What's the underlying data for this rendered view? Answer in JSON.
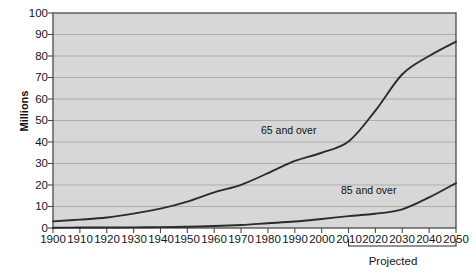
{
  "chart_data": {
    "type": "line",
    "title": "",
    "xlabel": "",
    "ylabel": "Millions",
    "xlim": [
      1900,
      2050
    ],
    "ylim": [
      0,
      100
    ],
    "grid": true,
    "legend_position": "inline-annotation",
    "x": [
      1900,
      1910,
      1920,
      1930,
      1940,
      1950,
      1960,
      1970,
      1980,
      1990,
      2000,
      2010,
      2020,
      2030,
      2040,
      2050
    ],
    "xtick_labels": [
      "1900",
      "1910",
      "1920",
      "1930",
      "1940",
      "1950",
      "1960",
      "1970",
      "1980",
      "1990",
      "2000",
      "2010",
      "2020",
      "2030",
      "2040",
      "2050"
    ],
    "ytick_labels": [
      "0",
      "10",
      "20",
      "30",
      "40",
      "50",
      "60",
      "70",
      "80",
      "90",
      "100"
    ],
    "ytick_values": [
      0,
      10,
      20,
      30,
      40,
      50,
      60,
      70,
      80,
      90,
      100
    ],
    "series": [
      {
        "name": "65 and over",
        "label": "65 and over",
        "values": [
          3.1,
          3.9,
          4.9,
          6.7,
          9.0,
          12.3,
          16.6,
          20.1,
          25.5,
          31.2,
          35.0,
          40.2,
          54.6,
          71.5,
          80.0,
          86.7
        ],
        "color": "#2b2b2b"
      },
      {
        "name": "85 and over",
        "label": "85 and over",
        "values": [
          0.1,
          0.2,
          0.2,
          0.3,
          0.4,
          0.6,
          0.9,
          1.4,
          2.2,
          3.0,
          4.2,
          5.5,
          6.6,
          8.7,
          14.2,
          20.9
        ],
        "color": "#2b2b2b"
      }
    ],
    "annotations": [
      {
        "text": "Projected",
        "from_x": 2010,
        "to_x": 2050,
        "style": "bracket-below-axis"
      }
    ],
    "plot_background": "#d7d7d7",
    "grid_color": "#a8a8a8",
    "axis_color": "#4a4a4a"
  },
  "labels": {
    "ylabel": "Millions",
    "projected": "Projected",
    "series_65": "65 and over",
    "series_85": "85 and over"
  }
}
